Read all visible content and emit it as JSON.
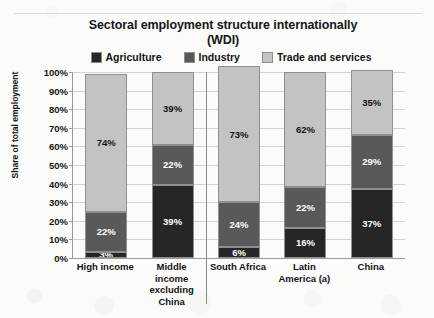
{
  "chart_data": {
    "type": "bar",
    "subtype": "stacked-100-percent",
    "title": "Sectoral employment structure internationally (WDI)",
    "title_lines": [
      "Sectoral employment structure internationally",
      "(WDI)"
    ],
    "xlabel": "",
    "ylabel": "Share of total employment",
    "ylim": [
      0,
      100
    ],
    "y_ticks": [
      "0%",
      "10%",
      "20%",
      "30%",
      "40%",
      "50%",
      "60%",
      "70%",
      "80%",
      "90%",
      "100%"
    ],
    "grid": true,
    "legend_position": "top",
    "categories": [
      "High income",
      "Middle income excluding China",
      "South Africa",
      "Latin America (a)",
      "China"
    ],
    "category_lines": [
      [
        "High income"
      ],
      [
        "Middle",
        "income",
        "excluding",
        "China"
      ],
      [
        "South Africa"
      ],
      [
        "Latin",
        "America (a)"
      ],
      [
        "China"
      ]
    ],
    "series": [
      {
        "name": "Agriculture",
        "color": "#262626",
        "label_color": "#ffffff",
        "values": [
          3,
          39,
          6,
          16,
          37
        ],
        "labels": [
          "3%",
          "39%",
          "6%",
          "16%",
          "37%"
        ]
      },
      {
        "name": "Industry",
        "color": "#595959",
        "label_color": "#ffffff",
        "values": [
          22,
          22,
          24,
          22,
          29
        ],
        "labels": [
          "22%",
          "22%",
          "24%",
          "22%",
          "29%"
        ]
      },
      {
        "name": "Trade and services",
        "color": "#c3c3c3",
        "label_color": "#141414",
        "values": [
          74,
          39,
          73,
          62,
          35
        ],
        "labels": [
          "74%",
          "39%",
          "73%",
          "62%",
          "35%"
        ]
      }
    ],
    "divider_after_category_index": 1
  }
}
